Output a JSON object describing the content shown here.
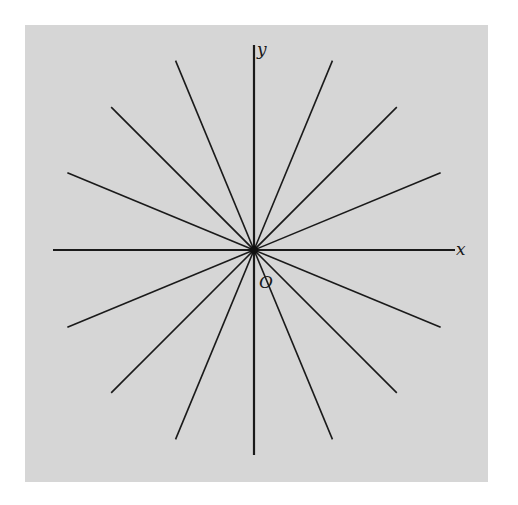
{
  "figure": {
    "background_color": "#d6d6d6",
    "line_color": "#1a1a1a",
    "axis_labels": {
      "x": "x",
      "y": "y",
      "origin": "O"
    },
    "radial_line_angles_deg": [
      22.5,
      45,
      67.5,
      112.5,
      135,
      157.5
    ]
  }
}
